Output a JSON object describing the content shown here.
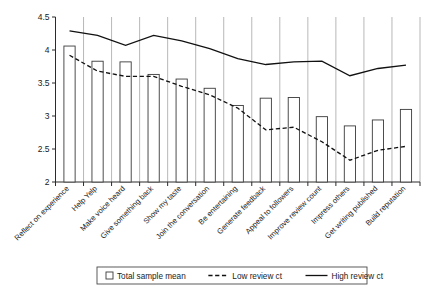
{
  "chart_data": {
    "type": "bar",
    "title": "",
    "subtitle": "",
    "xlabel": "",
    "ylabel": "",
    "ylim": [
      2,
      4.5
    ],
    "ytick_values": [
      2,
      2.5,
      3,
      3.5,
      4,
      4.5
    ],
    "ytick_labels": [
      "2",
      "2.5",
      "3",
      "3.5",
      "4",
      "4.5"
    ],
    "grid": true,
    "grid_axis": "x",
    "legend_position": "bottom",
    "categories": [
      "Reflect on experience",
      "Help Yelp",
      "Make voice heard",
      "Give something back",
      "Show my taste",
      "Join the conversation",
      "Be entertaining",
      "Generate feedback",
      "Appeal to followers",
      "Improve review count",
      "Impress others",
      "Get writing published",
      "Build reputation"
    ],
    "series": [
      {
        "name": "Total sample mean",
        "type": "bar",
        "style": "open-white-bar",
        "values": [
          4.06,
          3.83,
          3.82,
          3.63,
          3.56,
          3.42,
          3.16,
          3.27,
          3.28,
          2.99,
          2.85,
          2.94,
          3.1
        ]
      },
      {
        "name": "Low review ct",
        "type": "line",
        "style": "dashed",
        "values": [
          3.92,
          3.68,
          3.6,
          3.6,
          3.45,
          3.32,
          3.12,
          2.79,
          2.83,
          2.61,
          2.33,
          2.48,
          2.54
        ]
      },
      {
        "name": "High review ct",
        "type": "line",
        "style": "solid",
        "values": [
          4.29,
          4.22,
          4.07,
          4.22,
          4.14,
          4.02,
          3.87,
          3.78,
          3.82,
          3.83,
          3.61,
          3.72,
          3.77
        ]
      }
    ]
  },
  "legend": {
    "items": [
      {
        "label": "Total sample mean",
        "marker": "open-square"
      },
      {
        "label": "Low review ct",
        "marker": "dashed-line"
      },
      {
        "label": "High review ct",
        "marker": "solid-line"
      }
    ]
  },
  "colors": {
    "axis": "#2b2b2b",
    "grid": "#9a9a9a",
    "bar_fill": "#ffffff",
    "bar_stroke": "#3a3a3a",
    "line": "#111111",
    "background": "#ffffff"
  }
}
